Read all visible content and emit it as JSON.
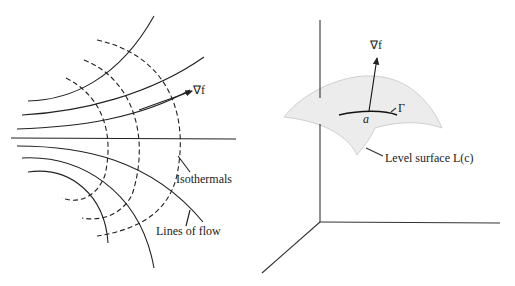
{
  "left_figure": {
    "labels": {
      "gradient": "∇f",
      "isothermals": "Isothermals",
      "lines_of_flow": "Lines of flow"
    }
  },
  "right_figure": {
    "labels": {
      "gradient": "∇f",
      "point": "a",
      "curve": "Γ",
      "surface": "Level surface L(c)"
    }
  },
  "colors": {
    "line": "#222222",
    "surface": "#ececec",
    "surface_edge": "#cccccc"
  }
}
